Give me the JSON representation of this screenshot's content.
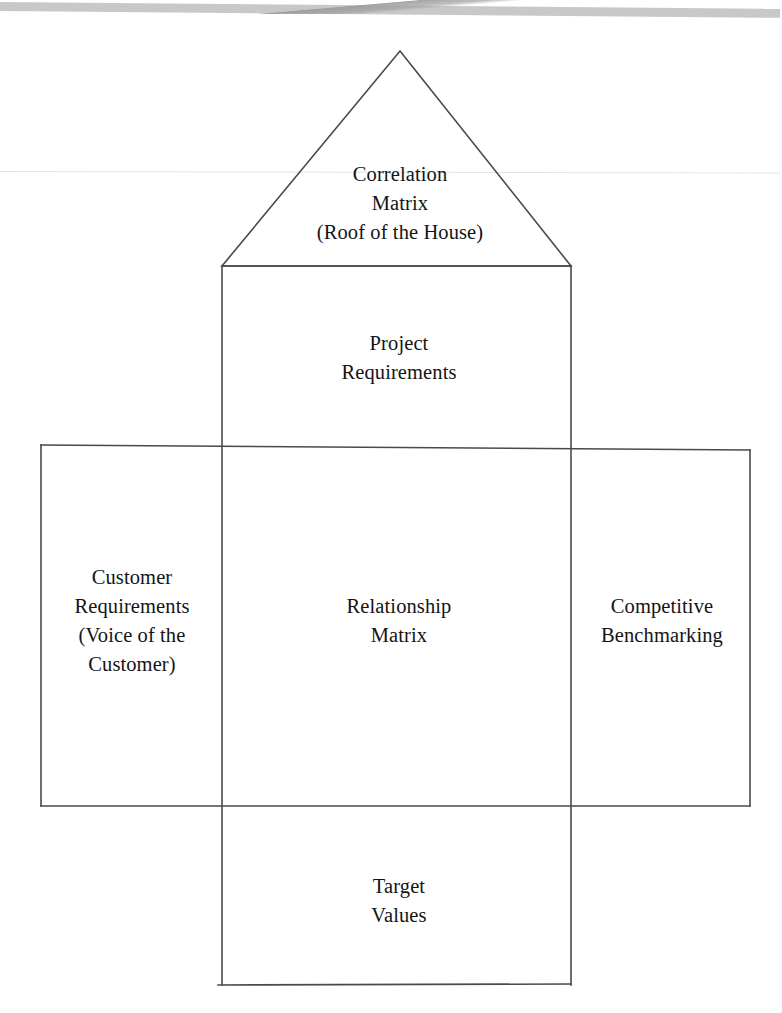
{
  "diagram": {
    "name": "House of Quality (QFD) diagram",
    "type": "qfd-house-of-quality",
    "stroke_color": "#4a4a4a",
    "background_color": "#ffffff",
    "text_color": "#141414",
    "sections": {
      "roof": {
        "label": "Correlation\nMatrix\n(Roof of the House)",
        "lines": [
          "Correlation",
          "Matrix",
          "(Roof of the House)"
        ],
        "shape": "triangle",
        "apex": [
          400,
          51
        ],
        "base_left": [
          222,
          266
        ],
        "base_right": [
          571,
          266
        ]
      },
      "top_center": {
        "label": "Project\nRequirements",
        "lines": [
          "Project",
          "Requirements"
        ],
        "shape": "rectangle"
      },
      "left": {
        "label": "Customer\nRequirements\n(Voice of the\nCustomer)",
        "lines": [
          "Customer",
          "Requirements",
          "(Voice of the",
          "Customer)"
        ],
        "shape": "rectangle"
      },
      "center": {
        "label": "Relationship\nMatrix",
        "lines": [
          "Relationship",
          "Matrix"
        ],
        "shape": "rectangle"
      },
      "right": {
        "label": "Competitive\nBenchmarking",
        "lines": [
          "Competitive",
          "Benchmarking"
        ],
        "shape": "rectangle"
      },
      "bottom_center": {
        "label": "Target\nValues",
        "lines": [
          "Target",
          "Values"
        ],
        "shape": "rectangle"
      }
    }
  }
}
